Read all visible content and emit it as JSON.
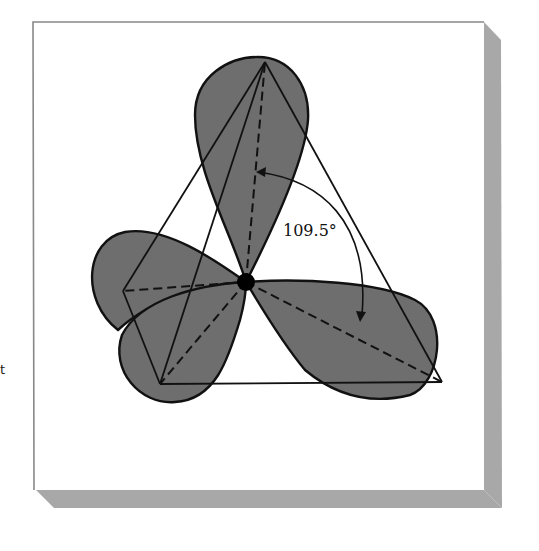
{
  "figure": {
    "type": "sp3 hybrid orbital tetrahedral geometry",
    "angle_label": "109.5°",
    "edge_fragment": "t",
    "colors": {
      "lobe_fill": "#6e6e6e",
      "outline": "#111111",
      "panel_border": "#888888",
      "panel_shadow": "#a8a8a8",
      "background": "#ffffff"
    },
    "atom": {
      "name": "central-atom",
      "cx": 246,
      "cy": 282
    },
    "vertices": [
      {
        "name": "top",
        "x": 265,
        "y": 62
      },
      {
        "name": "left-back",
        "x": 123,
        "y": 291
      },
      {
        "name": "bottom-left",
        "x": 160,
        "y": 384
      },
      {
        "name": "right",
        "x": 442,
        "y": 382
      }
    ]
  }
}
